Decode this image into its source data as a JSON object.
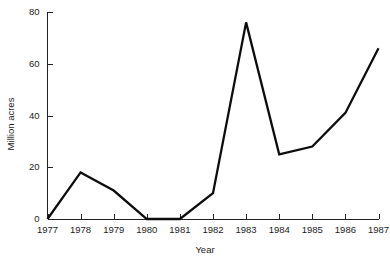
{
  "chart_data": {
    "type": "line",
    "title": "",
    "subtitle": "",
    "xlabel": "Year",
    "ylabel": "Million acres",
    "categories": [
      "1977",
      "1978",
      "1979",
      "1980",
      "1981",
      "1982",
      "1983",
      "1984",
      "1985",
      "1986",
      "1987"
    ],
    "x": [
      1977,
      1978,
      1979,
      1980,
      1981,
      1982,
      1983,
      1984,
      1985,
      1986,
      1987
    ],
    "values": [
      0,
      18,
      11,
      0,
      0,
      10,
      76,
      25,
      28,
      41,
      66
    ],
    "series": [
      {
        "name": "Million acres",
        "values": [
          0,
          18,
          11,
          0,
          0,
          10,
          76,
          25,
          28,
          41,
          66
        ]
      }
    ],
    "ylim": [
      0,
      80
    ],
    "yticks": [
      0,
      20,
      40,
      60,
      80
    ],
    "ytick_labels": [
      "0",
      "20",
      "40",
      "60",
      "80"
    ],
    "xtick_labels": [
      "1977",
      "1978",
      "1979",
      "1980",
      "1981",
      "1982",
      "1983",
      "1984",
      "1985",
      "1986",
      "1987"
    ],
    "grid": false,
    "legend": false,
    "legend_position": "none",
    "line_color": "#0d0d0d",
    "axis_color": "#222222",
    "background_color": "#ffffff",
    "annotations": []
  }
}
